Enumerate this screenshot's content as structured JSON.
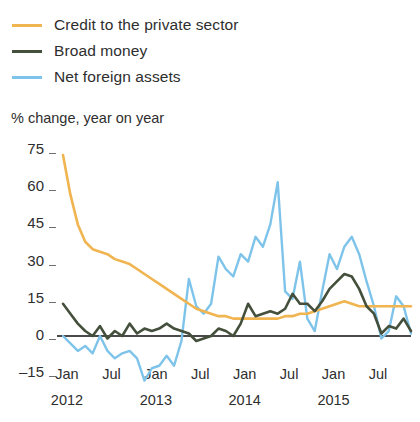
{
  "legend": {
    "position": "top-left",
    "items": [
      {
        "label": "Credit to the private sector",
        "color": "#f0b450",
        "key": "credit"
      },
      {
        "label": "Broad money",
        "color": "#44503c",
        "key": "broad_money"
      },
      {
        "label": "Net foreign assets",
        "color": "#7ec4ea",
        "key": "net_foreign_assets"
      }
    ]
  },
  "axis": {
    "y_title": "% change, year on year",
    "y_ticks": [
      "75",
      "60",
      "45",
      "30",
      "15",
      "0",
      "–15"
    ],
    "x_ticks": [
      {
        "month": "Jan",
        "year": "2012"
      },
      {
        "month": "Jul",
        "year": ""
      },
      {
        "month": "Jan",
        "year": "2013"
      },
      {
        "month": "Jul",
        "year": ""
      },
      {
        "month": "Jan",
        "year": "2014"
      },
      {
        "month": "Jul",
        "year": ""
      },
      {
        "month": "Jan",
        "year": "2015"
      },
      {
        "month": "Jul",
        "year": ""
      }
    ]
  },
  "chart_data": {
    "type": "line",
    "title": "",
    "subtitle": "",
    "xlabel": "",
    "ylabel": "% change, year on year",
    "ylim": [
      -18,
      78
    ],
    "xlim": [
      "2012-01",
      "2015-12"
    ],
    "grid": false,
    "zero_line": true,
    "legend_position": "top-left",
    "x": [
      "2012-01",
      "2012-02",
      "2012-03",
      "2012-04",
      "2012-05",
      "2012-06",
      "2012-07",
      "2012-08",
      "2012-09",
      "2012-10",
      "2012-11",
      "2012-12",
      "2013-01",
      "2013-02",
      "2013-03",
      "2013-04",
      "2013-05",
      "2013-06",
      "2013-07",
      "2013-08",
      "2013-09",
      "2013-10",
      "2013-11",
      "2013-12",
      "2014-01",
      "2014-02",
      "2014-03",
      "2014-04",
      "2014-05",
      "2014-06",
      "2014-07",
      "2014-08",
      "2014-09",
      "2014-10",
      "2014-11",
      "2014-12",
      "2015-01",
      "2015-02",
      "2015-03",
      "2015-04",
      "2015-05",
      "2015-06",
      "2015-07",
      "2015-08",
      "2015-09",
      "2015-10",
      "2015-11",
      "2015-12"
    ],
    "series": [
      {
        "name": "Credit to the private sector",
        "color": "#f0b450",
        "values": [
          73,
          57,
          45,
          38,
          35,
          34,
          33,
          31,
          30,
          29,
          27,
          25,
          23,
          21,
          19,
          17,
          15,
          13,
          11,
          10,
          9,
          8,
          8,
          7,
          7,
          7,
          7,
          7,
          7,
          7,
          8,
          8,
          9,
          9,
          10,
          11,
          12,
          13,
          14,
          13,
          12,
          12,
          12,
          12,
          12,
          12,
          12,
          12
        ]
      },
      {
        "name": "Broad money",
        "color": "#44503c",
        "values": [
          13,
          9,
          5,
          2,
          0,
          4,
          -1,
          2,
          0,
          5,
          1,
          3,
          2,
          3,
          5,
          3,
          2,
          1,
          -2,
          -1,
          0,
          3,
          2,
          0,
          5,
          13,
          8,
          9,
          10,
          9,
          11,
          17,
          13,
          13,
          10,
          14,
          19,
          22,
          25,
          24,
          19,
          12,
          9,
          1,
          4,
          3,
          7,
          2
        ]
      },
      {
        "name": "Net foreign assets",
        "color": "#7ec4ea",
        "values": [
          0,
          -3,
          -6,
          -4,
          -7,
          0,
          -6,
          -9,
          -7,
          -6,
          -9,
          -18,
          -13,
          -12,
          -8,
          -12,
          -2,
          23,
          12,
          9,
          13,
          32,
          27,
          24,
          33,
          30,
          40,
          36,
          45,
          62,
          18,
          15,
          30,
          7,
          2,
          18,
          33,
          27,
          36,
          40,
          33,
          22,
          12,
          -1,
          2,
          16,
          12,
          1
        ]
      }
    ]
  }
}
